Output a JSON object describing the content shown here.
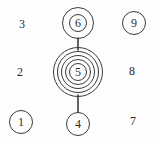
{
  "diagram": {
    "background_color": "#fdfdfd",
    "stroke_color": "#3b3b3b",
    "text_color": "#2e2e2e",
    "width": 160,
    "height": 144,
    "grid": {
      "columns": 3,
      "rows": 3,
      "column_x": [
        22,
        78,
        134
      ],
      "row_y": [
        24,
        72,
        120
      ]
    },
    "nodes": [
      {
        "id": "n3",
        "label": "3",
        "col": 0,
        "row": 0,
        "x": 22,
        "y": 24,
        "style": "plain",
        "rings": 0,
        "radius": 0
      },
      {
        "id": "n6",
        "label": "6",
        "col": 1,
        "row": 0,
        "x": 78,
        "y": 23,
        "style": "double-circle",
        "rings": 2,
        "radius": 15
      },
      {
        "id": "n9",
        "label": "9",
        "col": 2,
        "row": 0,
        "x": 134,
        "y": 23,
        "style": "single-circle",
        "rings": 1,
        "radius": 11
      },
      {
        "id": "n2",
        "label": "2",
        "col": 0,
        "row": 1,
        "x": 20,
        "y": 72,
        "style": "plain",
        "rings": 0,
        "radius": 0
      },
      {
        "id": "n5",
        "label": "5",
        "col": 1,
        "row": 1,
        "x": 78,
        "y": 72,
        "style": "multi-ring",
        "rings": 5,
        "radius": 24
      },
      {
        "id": "n8",
        "label": "8",
        "col": 2,
        "row": 1,
        "x": 132,
        "y": 71,
        "style": "plain",
        "rings": 0,
        "radius": 0
      },
      {
        "id": "n1",
        "label": "1",
        "col": 0,
        "row": 2,
        "x": 21,
        "y": 122,
        "style": "single-circle",
        "rings": 1,
        "radius": 11
      },
      {
        "id": "n4",
        "label": "4",
        "col": 1,
        "row": 2,
        "x": 78,
        "y": 124,
        "style": "single-circle",
        "rings": 1,
        "radius": 11
      },
      {
        "id": "n7",
        "label": "7",
        "col": 2,
        "row": 2,
        "x": 133,
        "y": 121,
        "style": "plain",
        "rings": 0,
        "radius": 0
      }
    ],
    "edges": [
      {
        "id": "e65",
        "from": "n6",
        "to": "n5",
        "x1": 78,
        "y1": 38,
        "x2": 78,
        "y2": 50,
        "orientation": "vertical"
      },
      {
        "id": "e54",
        "from": "n5",
        "to": "n4",
        "x1": 78,
        "y1": 95,
        "x2": 78,
        "y2": 113,
        "orientation": "vertical"
      }
    ]
  }
}
